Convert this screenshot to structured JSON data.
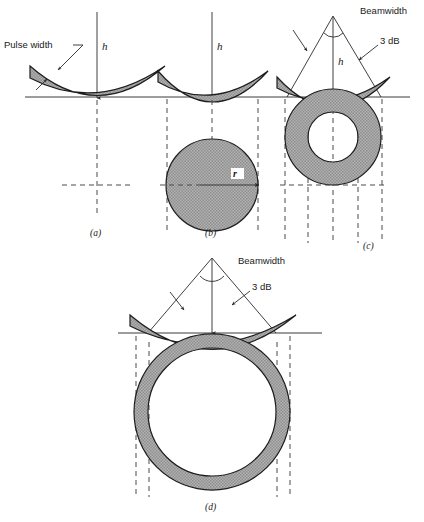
{
  "figure": {
    "title_caption": "",
    "panels": [
      {
        "id": "a",
        "caption": "(a)",
        "altitude_label": "h",
        "annotations": [
          "Pulse width"
        ],
        "description": "narrow pulse, no beam cone, shallow spherical shell cap"
      },
      {
        "id": "b",
        "caption": "(b)",
        "altitude_label": "h",
        "radius_label": "r",
        "annotations": [],
        "description": "wider pulse, filled circular footprint of radius r"
      },
      {
        "id": "c",
        "caption": "(c)",
        "altitude_label": "h",
        "annotations": [
          "Beamwidth",
          "3 dB"
        ],
        "description": "beam limited, annulus footprint"
      },
      {
        "id": "d",
        "caption": "(d)",
        "altitude_label": "",
        "annotations": [
          "Beamwidth",
          "3 dB"
        ],
        "description": "wide beam, thin annulus footprint"
      }
    ],
    "labels": {
      "pulse_width": "Pulse width",
      "beamwidth": "Beamwidth",
      "three_db": "3 dB",
      "altitude": "h",
      "radius": "r"
    },
    "colors": {
      "shell_fill": "#a8a8a8",
      "line": "#3a3a3a",
      "dash": "#4a4a4a",
      "text": "#1a1a1a",
      "background": "#ffffff"
    }
  }
}
